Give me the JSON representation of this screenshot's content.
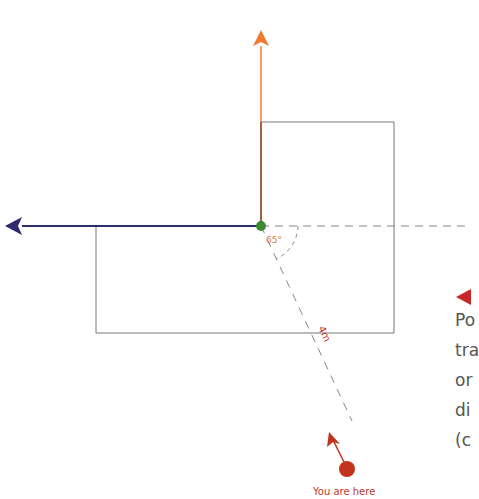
{
  "diagram": {
    "angle_label": "65°",
    "distance_label": "4m",
    "marker_label": "You are here",
    "colors": {
      "north_arrow": "#f07a30",
      "west_arrow": "#2e2a6e",
      "origin_dot": "#3a8a2e",
      "you_marker": "#c0341d",
      "box_stroke": "#666666",
      "dashed": "#888888",
      "side_arrow": "#c8282a"
    }
  },
  "side_text": {
    "lines": [
      "Po",
      "tra",
      "or",
      "di",
      "(c"
    ]
  }
}
